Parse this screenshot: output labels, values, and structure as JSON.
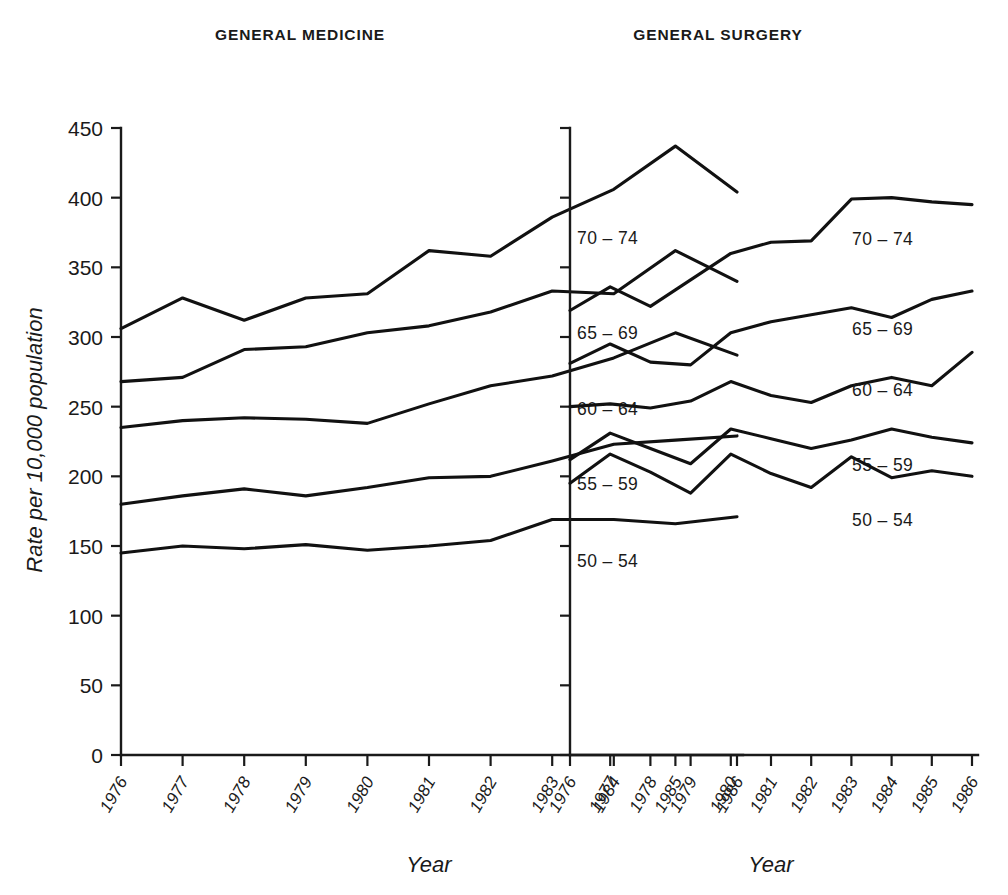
{
  "figure": {
    "yaxis_title": "Rate per 10,000 population",
    "xaxis_title_left": "Year",
    "xaxis_title_right": "Year"
  },
  "panels": [
    {
      "title": "GENERAL MEDICINE"
    },
    {
      "title": "GENERAL SURGERY"
    }
  ],
  "series_labels": [
    "70 – 74",
    "65 – 69",
    "60 – 64",
    "55 – 59",
    "50 – 54"
  ],
  "chart_data": [
    {
      "type": "line",
      "title": "GENERAL MEDICINE",
      "xlabel": "Year",
      "ylabel": "Rate per 10,000 population",
      "x": [
        "1976",
        "1977",
        "1978",
        "1979",
        "1980",
        "1981",
        "1982",
        "1983",
        "1984",
        "1985",
        "1986"
      ],
      "ylim": [
        0,
        450
      ],
      "yticks": [
        0,
        50,
        100,
        150,
        200,
        250,
        300,
        350,
        400,
        450
      ],
      "grid": false,
      "legend": "inline-right-of-line-end",
      "series": [
        {
          "name": "70 – 74",
          "values": [
            306,
            328,
            312,
            328,
            331,
            362,
            358,
            386,
            406,
            437,
            404
          ]
        },
        {
          "name": "65 – 69",
          "values": [
            268,
            271,
            291,
            293,
            303,
            308,
            318,
            333,
            331,
            362,
            340
          ]
        },
        {
          "name": "60 – 64",
          "values": [
            235,
            240,
            242,
            241,
            238,
            252,
            265,
            272,
            285,
            303,
            287
          ]
        },
        {
          "name": "55 – 59",
          "values": [
            180,
            186,
            191,
            186,
            192,
            199,
            200,
            211,
            223,
            226,
            229
          ]
        },
        {
          "name": "50 – 54",
          "values": [
            145,
            150,
            148,
            151,
            147,
            150,
            154,
            169,
            169,
            166,
            171
          ]
        }
      ]
    },
    {
      "type": "line",
      "title": "GENERAL SURGERY",
      "xlabel": "Year",
      "ylabel": "Rate per 10,000 population",
      "x": [
        "1976",
        "1977",
        "1978",
        "1979",
        "1980",
        "1981",
        "1982",
        "1983",
        "1984",
        "1985",
        "1986"
      ],
      "ylim": [
        0,
        450
      ],
      "yticks": [
        0,
        50,
        100,
        150,
        200,
        250,
        300,
        350,
        400,
        450
      ],
      "grid": false,
      "legend": "inline-right-of-line-end",
      "series": [
        {
          "name": "70 – 74",
          "values": [
            319,
            336,
            322,
            341,
            360,
            368,
            369,
            399,
            400,
            397,
            395
          ]
        },
        {
          "name": "65 – 69",
          "values": [
            281,
            295,
            282,
            280,
            303,
            311,
            316,
            321,
            314,
            327,
            333
          ]
        },
        {
          "name": "60 – 64",
          "values": [
            250,
            252,
            249,
            254,
            268,
            258,
            253,
            265,
            271,
            265,
            289
          ]
        },
        {
          "name": "55 – 59",
          "values": [
            212,
            231,
            220,
            209,
            234,
            227,
            220,
            226,
            234,
            228,
            224
          ]
        },
        {
          "name": "50 – 54",
          "values": [
            195,
            216,
            203,
            188,
            216,
            202,
            192,
            214,
            199,
            204,
            200
          ]
        }
      ]
    }
  ]
}
